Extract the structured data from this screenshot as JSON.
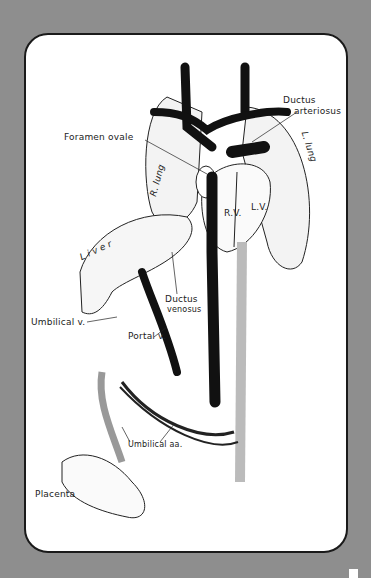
{
  "colors": {
    "background": "#8e8e8e",
    "card": "#ffffff",
    "ink": "#1a1a1a"
  },
  "labels": {
    "ductus_arteriosus_1": "Ductus",
    "ductus_arteriosus_2": "arteriosus",
    "foramen_ovale": "Foramen ovale",
    "r_lung": "R. lung",
    "l_lung": "L. lung",
    "rv": "R.V.",
    "lv": "L.V.",
    "liver": "Liver",
    "ductus_venosus_1": "Ductus",
    "ductus_venosus_2": "venosus",
    "umbilical_v": "Umbilical v.",
    "portal_v": "Portal v.",
    "umbilical_aa": "Umbilical aa.",
    "placenta": "Placenta"
  }
}
